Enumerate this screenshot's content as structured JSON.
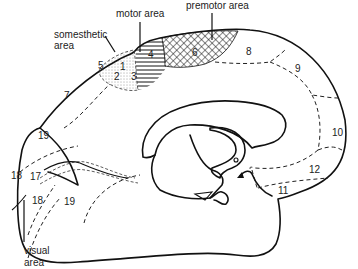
{
  "diagram": {
    "callouts": {
      "motor": "motor area",
      "premotor": "premotor area",
      "somesthetic_line1": "somesthetic",
      "somesthetic_line2": "area",
      "visual_line1": "visual",
      "visual_line2": "area"
    },
    "areas": {
      "a1": "1",
      "a2": "2",
      "a3": "3",
      "a4": "4",
      "a5": "5",
      "a6": "6",
      "a7": "7",
      "a8": "8",
      "a9": "9",
      "a10": "10",
      "a11": "11",
      "a12": "12",
      "a17": "17",
      "a18_upper": "18",
      "a18_lower": "18",
      "a19_upper": "19",
      "a19_lower": "19"
    },
    "colors": {
      "ink": "#111111",
      "background": "#ffffff"
    }
  }
}
